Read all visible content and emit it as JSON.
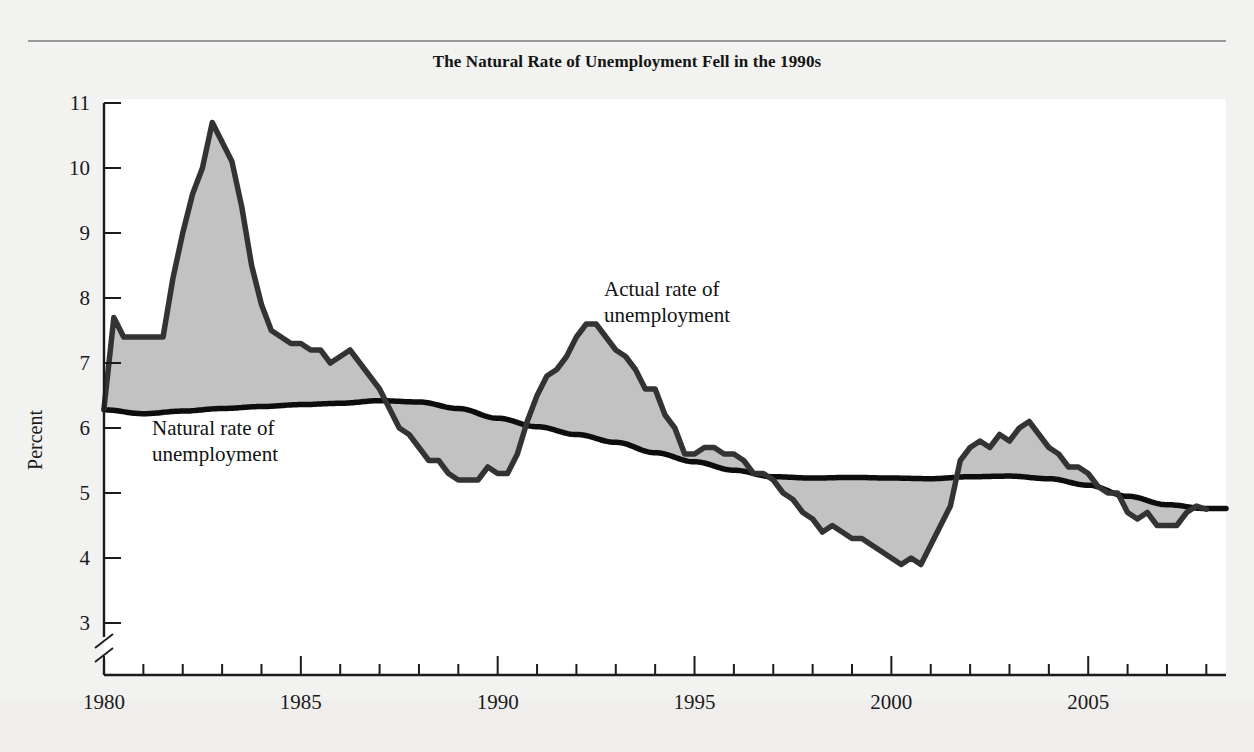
{
  "figure": {
    "title": "The Natural Rate of Unemployment Fell in the 1990s",
    "percent_axis_label": "Percent",
    "annotation_actual_line1": "Actual rate of",
    "annotation_actual_line2": "unemployment",
    "annotation_natural_line1": "Natural rate of",
    "annotation_natural_line2": "unemployment",
    "colors": {
      "fill": "#c2c2c2",
      "actual_line": "#333333",
      "natural_line": "#0d0d0d",
      "axis": "#1b1b1b",
      "page_background": "#f2f2f1",
      "plot_background": "#ffffff",
      "rule": "#9a9a9a"
    }
  },
  "chart_data": {
    "type": "area",
    "title": "The Natural Rate of Unemployment Fell in the 1990s",
    "xlabel": "",
    "ylabel": "Percent",
    "xlim": [
      1980,
      2008.5
    ],
    "ylim": [
      3,
      11
    ],
    "y_axis_break_below": 3,
    "grid": false,
    "legend": "annotations",
    "y_ticks": [
      3,
      4,
      5,
      6,
      7,
      8,
      9,
      10,
      11
    ],
    "x_ticks_major": [
      1980,
      1985,
      1990,
      1995,
      2000,
      2005
    ],
    "x_ticks_minor_interval": 1,
    "x_tick_labels": [
      "1980",
      "1985",
      "1990",
      "1995",
      "2000",
      "2005"
    ],
    "y_tick_labels": [
      "3",
      "4",
      "5",
      "6",
      "7",
      "8",
      "9",
      "10",
      "11"
    ],
    "annotations": [
      {
        "text": "Actual rate of unemployment",
        "x": 1992.8,
        "y": 8.3
      },
      {
        "text": "Natural rate of unemployment",
        "x": 1981.6,
        "y": 6.0
      }
    ],
    "series": [
      {
        "name": "Actual rate of unemployment",
        "style": "dark-gray-line-with-shaded-area-to-natural-rate",
        "x": [
          1980.0,
          1980.25,
          1980.5,
          1980.75,
          1981.0,
          1981.25,
          1981.5,
          1981.75,
          1982.0,
          1982.25,
          1982.5,
          1982.75,
          1983.0,
          1983.25,
          1983.5,
          1983.75,
          1984.0,
          1984.25,
          1984.5,
          1984.75,
          1985.0,
          1985.25,
          1985.5,
          1985.75,
          1986.0,
          1986.25,
          1986.5,
          1986.75,
          1987.0,
          1987.25,
          1987.5,
          1987.75,
          1988.0,
          1988.25,
          1988.5,
          1988.75,
          1989.0,
          1989.25,
          1989.5,
          1989.75,
          1990.0,
          1990.25,
          1990.5,
          1990.75,
          1991.0,
          1991.25,
          1991.5,
          1991.75,
          1992.0,
          1992.25,
          1992.5,
          1992.75,
          1993.0,
          1993.25,
          1993.5,
          1993.75,
          1994.0,
          1994.25,
          1994.5,
          1994.75,
          1995.0,
          1995.25,
          1995.5,
          1995.75,
          1996.0,
          1996.25,
          1996.5,
          1996.75,
          1997.0,
          1997.25,
          1997.5,
          1997.75,
          1998.0,
          1998.25,
          1998.5,
          1998.75,
          1999.0,
          1999.25,
          1999.5,
          1999.75,
          2000.0,
          2000.25,
          2000.5,
          2000.75,
          2001.0,
          2001.25,
          2001.5,
          2001.75,
          2002.0,
          2002.25,
          2002.5,
          2002.75,
          2003.0,
          2003.25,
          2003.5,
          2003.75,
          2004.0,
          2004.25,
          2004.5,
          2004.75,
          2005.0,
          2005.25,
          2005.5,
          2005.75,
          2006.0,
          2006.25,
          2006.5,
          2006.75,
          2007.0,
          2007.25,
          2007.5,
          2007.75,
          2008.0
        ],
        "y": [
          6.3,
          7.7,
          7.4,
          7.4,
          7.4,
          7.4,
          7.4,
          8.3,
          9.0,
          9.6,
          10.0,
          10.7,
          10.4,
          10.1,
          9.4,
          8.5,
          7.9,
          7.5,
          7.4,
          7.3,
          7.3,
          7.2,
          7.2,
          7.0,
          7.1,
          7.2,
          7.0,
          6.8,
          6.6,
          6.3,
          6.0,
          5.9,
          5.7,
          5.5,
          5.5,
          5.3,
          5.2,
          5.2,
          5.2,
          5.4,
          5.3,
          5.3,
          5.6,
          6.1,
          6.5,
          6.8,
          6.9,
          7.1,
          7.4,
          7.6,
          7.6,
          7.4,
          7.2,
          7.1,
          6.9,
          6.6,
          6.6,
          6.2,
          6.0,
          5.6,
          5.6,
          5.7,
          5.7,
          5.6,
          5.6,
          5.5,
          5.3,
          5.3,
          5.2,
          5.0,
          4.9,
          4.7,
          4.6,
          4.4,
          4.5,
          4.4,
          4.3,
          4.3,
          4.2,
          4.1,
          4.0,
          3.9,
          4.0,
          3.9,
          4.2,
          4.5,
          4.8,
          5.5,
          5.7,
          5.8,
          5.7,
          5.9,
          5.8,
          6.0,
          6.1,
          5.9,
          5.7,
          5.6,
          5.4,
          5.4,
          5.3,
          5.1,
          5.0,
          5.0,
          4.7,
          4.6,
          4.7,
          4.5,
          4.5,
          4.5,
          4.7,
          4.8,
          4.75
        ]
      },
      {
        "name": "Natural rate of unemployment",
        "style": "black-smooth-line",
        "x": [
          1980.0,
          1981.0,
          1982.0,
          1983.0,
          1984.0,
          1985.0,
          1986.0,
          1987.0,
          1988.0,
          1989.0,
          1990.0,
          1991.0,
          1992.0,
          1993.0,
          1994.0,
          1995.0,
          1996.0,
          1997.0,
          1998.0,
          1999.0,
          2000.0,
          2001.0,
          2002.0,
          2003.0,
          2004.0,
          2005.0,
          2006.0,
          2007.0,
          2008.0
        ],
        "y": [
          6.28,
          6.22,
          6.26,
          6.3,
          6.33,
          6.36,
          6.38,
          6.42,
          6.4,
          6.3,
          6.15,
          6.02,
          5.9,
          5.78,
          5.62,
          5.48,
          5.35,
          5.25,
          5.23,
          5.24,
          5.23,
          5.22,
          5.25,
          5.26,
          5.22,
          5.12,
          4.95,
          4.82,
          4.76
        ]
      }
    ]
  }
}
